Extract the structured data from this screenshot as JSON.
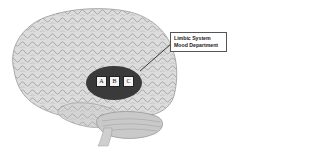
{
  "diagram": {
    "region": {
      "name": "limbic-system-region",
      "fill": "#3a3a3a",
      "boxes": [
        {
          "label": "A"
        },
        {
          "label": "B"
        },
        {
          "label": "C"
        }
      ]
    },
    "callout": {
      "line1": "Limbic System",
      "line2": "Mood Department"
    },
    "colors": {
      "background": "#ffffff",
      "brain_fill": "#d9d9d9",
      "brain_gyri": "#8a8a8a",
      "ellipse": "#3a3a3a",
      "callout_border": "#555555"
    }
  }
}
